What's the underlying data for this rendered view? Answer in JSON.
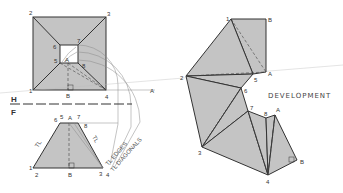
{
  "diagram": {
    "type": "descriptive-geometry-development",
    "title_label": "DEVELOPMENT",
    "reference_line": {
      "top": "H",
      "bottom": "F"
    },
    "top_view": {
      "outer_labels": [
        "1",
        "2",
        "3",
        "4"
      ],
      "inner_labels": [
        "5",
        "6",
        "7",
        "8"
      ],
      "extra_labels": [
        "A",
        "B"
      ]
    },
    "front_view": {
      "top_labels": [
        "6",
        "5",
        "A",
        "7",
        "8"
      ],
      "bottom_labels": [
        "1",
        "2",
        "B",
        "3",
        "4"
      ],
      "tl_left": "TL",
      "tl_right": "TL"
    },
    "true_length": {
      "edges_label": "TL EDGES",
      "diagonals_label": "TL DIAGONALS",
      "arc_label": "A"
    },
    "development": {
      "labels": [
        "1",
        "B",
        "2",
        "5",
        "A",
        "6",
        "7",
        "8",
        "A",
        "3",
        "4",
        "B"
      ]
    },
    "colors": {
      "fill": "#c4c4c4",
      "line": "#333333",
      "background": "#ffffff"
    }
  }
}
